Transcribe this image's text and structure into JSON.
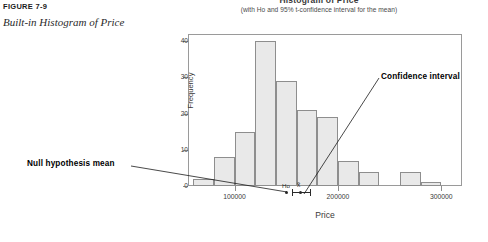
{
  "figure": {
    "number": "FIGURE 7-9",
    "title": "Built-in Histogram of Price"
  },
  "chart": {
    "title": "Histogram of Price",
    "subtitle": "(with Ho and 95% t-confidence interval for the mean)",
    "xlabel": "Price",
    "ylabel": "Frequency"
  },
  "annotations": {
    "null_hypothesis_label": "Null hypothesis mean",
    "confidence_interval_label": "Confidence interval",
    "ho_marker_label": "Ho",
    "xbar_marker_label": "x̄"
  },
  "chart_data": {
    "type": "bar",
    "title": "Histogram of Price",
    "subtitle": "(with Ho and 95% t-confidence interval for the mean)",
    "xlabel": "Price",
    "ylabel": "Frequency",
    "xlim": [
      55000,
      320000
    ],
    "ylim": [
      0,
      42
    ],
    "xticks": [
      100000,
      200000,
      300000
    ],
    "xtick_labels": [
      "100000",
      "200000",
      "300000"
    ],
    "yticks": [
      0,
      10,
      20,
      30,
      40
    ],
    "ytick_labels": [
      "0",
      "10",
      "20",
      "30",
      "40"
    ],
    "grid": false,
    "legend": false,
    "bin_width": 20000,
    "bin_starts": [
      60000,
      80000,
      100000,
      120000,
      140000,
      160000,
      180000,
      200000,
      220000,
      240000,
      260000,
      280000,
      300000
    ],
    "categories": [
      "60000",
      "80000",
      "100000",
      "120000",
      "140000",
      "160000",
      "180000",
      "200000",
      "220000",
      "240000",
      "260000",
      "280000",
      "300000"
    ],
    "values": [
      2,
      8,
      15,
      40,
      29,
      21,
      19,
      7,
      4,
      0,
      4,
      1,
      0
    ],
    "markers": {
      "ho": 145000,
      "xbar": 155000,
      "ci_low": 150000,
      "ci_high": 168000
    }
  },
  "colors": {
    "bar_fill": "#e9e9e9",
    "bar_border": "#8e8e8e",
    "axis": "#8e8e8e",
    "text": "#3a3a3a",
    "annotation": "#000000"
  }
}
